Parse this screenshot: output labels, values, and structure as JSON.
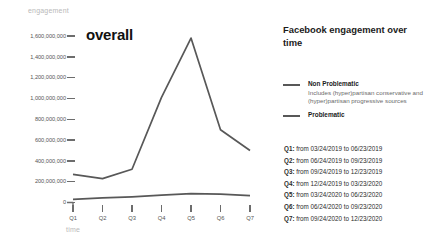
{
  "chart": {
    "title": "overall",
    "y_axis_title": "engagement",
    "x_axis_title": "time"
  },
  "info": {
    "title": "Facebook engagement over time",
    "legend": [
      {
        "label": "Non Problematic",
        "description": "Includes (hyper)partisan conservative and (hyper)partisan progressive sources",
        "color": "#585858"
      },
      {
        "label": "Problematic",
        "description": "",
        "color": "#585858"
      }
    ],
    "quarters": [
      "Q1: from 03/24/2019 to 06/23/2019",
      "Q2: from 06/24/2019 to 09/23/2019",
      "Q3: from 09/24/2019 to 12/23/2019",
      "Q4: from 12/24/2019 to 03/23/2020",
      "Q5: from 03/24/2020 to 06/23/2020",
      "Q6: from 06/24/2020 to 09/23/2020",
      "Q7: from 09/24/2020 to 12/23/2020"
    ]
  },
  "chart_data": {
    "type": "line",
    "title": "overall",
    "xlabel": "time",
    "ylabel": "engagement",
    "categories": [
      "Q1",
      "Q2",
      "Q3",
      "Q4",
      "Q5",
      "Q6",
      "Q7"
    ],
    "ylim": [
      0,
      1600000000
    ],
    "yticks": [
      0,
      200000000,
      400000000,
      600000000,
      800000000,
      1000000000,
      1200000000,
      1400000000,
      1600000000
    ],
    "ytick_labels": [
      "0",
      "200,000,000",
      "400,000,000",
      "600,000,000",
      "800,000,000",
      "1,000,000,000",
      "1,200,000,000",
      "1,400,000,000",
      "1,600,000,000"
    ],
    "grid": false,
    "legend_position": "right",
    "series": [
      {
        "name": "Non Problematic",
        "color": "#585858",
        "values": [
          270000000,
          230000000,
          320000000,
          1010000000,
          1580000000,
          700000000,
          500000000
        ]
      },
      {
        "name": "Problematic",
        "color": "#585858",
        "values": [
          30000000,
          45000000,
          55000000,
          70000000,
          85000000,
          80000000,
          65000000
        ]
      }
    ]
  }
}
